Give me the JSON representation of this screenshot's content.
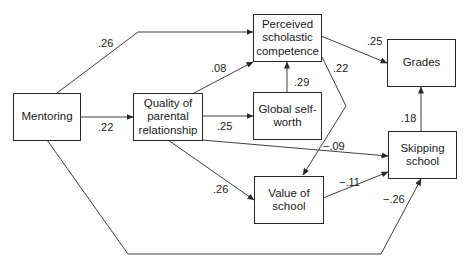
{
  "diagram": {
    "type": "path-diagram",
    "nodes": {
      "mentoring": "Mentoring",
      "parental": "Quality of\nparental\nrelationship",
      "scholastic": "Perceived\nscholastic\ncompetence",
      "selfworth": "Global self-\nworth",
      "value": "Value of\nschool",
      "grades": "Grades",
      "skipping": "Skipping\nschool"
    },
    "edges": [
      {
        "from": "Mentoring",
        "to": "Perceived scholastic competence",
        "coef": ".26"
      },
      {
        "from": "Mentoring",
        "to": "Quality of parental relationship",
        "coef": ".22"
      },
      {
        "from": "Mentoring",
        "to": "Skipping school",
        "coef": "−.26"
      },
      {
        "from": "Quality of parental relationship",
        "to": "Perceived scholastic competence",
        "coef": ".08"
      },
      {
        "from": "Quality of parental relationship",
        "to": "Global self-worth",
        "coef": ".25"
      },
      {
        "from": "Quality of parental relationship",
        "to": "Skipping school",
        "coef": "−.09"
      },
      {
        "from": "Quality of parental relationship",
        "to": "Value of school",
        "coef": ".26"
      },
      {
        "from": "Global self-worth",
        "to": "Perceived scholastic competence",
        "coef": ".29"
      },
      {
        "from": "Perceived scholastic competence",
        "to": "Grades",
        "coef": ".25"
      },
      {
        "from": "Perceived scholastic competence",
        "to": "Value of school",
        "coef": ".22"
      },
      {
        "from": "Value of school",
        "to": "Skipping school",
        "coef": "−.11"
      },
      {
        "from": "Skipping school",
        "to": "Grades",
        "coef": ".18"
      }
    ],
    "labels": {
      "m_sc": ".26",
      "m_pr": ".22",
      "m_sk": "−.26",
      "pr_sc": ".08",
      "pr_sw": ".25",
      "pr_sk": "−.09",
      "pr_vs": ".26",
      "sw_sc": ".29",
      "sc_gr": ".25",
      "sc_vs": ".22",
      "vs_sk": "−.11",
      "sk_gr": ".18"
    },
    "colors": {
      "line": "#2a2a2a",
      "text": "#1a1a1a",
      "background": "#ffffff"
    }
  }
}
